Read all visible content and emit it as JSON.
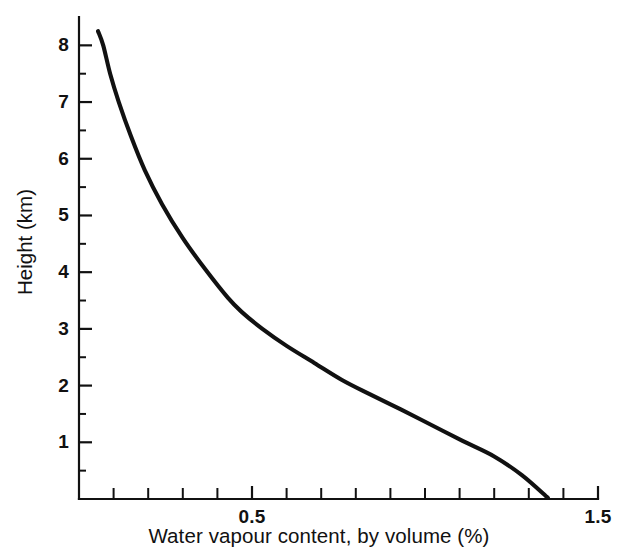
{
  "chart_data": {
    "type": "line",
    "title": "",
    "subtitle": "",
    "xlabel": "Water vapour content, by volume (%)",
    "ylabel": "Height (km)",
    "xlim": [
      0.0,
      1.5
    ],
    "ylim": [
      0.0,
      8.5
    ],
    "grid": false,
    "legend": null,
    "x_major_ticks": [
      0.5,
      1.5
    ],
    "x_major_tick_labels": [
      "0.5",
      "1.5"
    ],
    "x_minor_tick_step": 0.1,
    "x_minor_ticks": [
      0.1,
      0.2,
      0.3,
      0.4,
      0.6,
      0.7,
      0.8,
      0.9,
      1.0,
      1.1,
      1.2,
      1.3,
      1.4
    ],
    "y_major_ticks": [
      1,
      2,
      3,
      4,
      5,
      6,
      7,
      8
    ],
    "y_major_tick_labels": [
      "1",
      "2",
      "3",
      "4",
      "5",
      "6",
      "7",
      "8"
    ],
    "y_minor_tick_step": 0.5,
    "y_minor_ticks": [
      0.5,
      1.5,
      2.5,
      3.5,
      4.5,
      5.5,
      6.5,
      7.5
    ],
    "axis_color": "#111111",
    "curve_color": "#111111",
    "series": [
      {
        "name": "Water vapour profile",
        "x": [
          0.055,
          0.07,
          0.09,
          0.115,
          0.15,
          0.19,
          0.24,
          0.3,
          0.365,
          0.43,
          0.47,
          0.53,
          0.6,
          0.68,
          0.76,
          0.84,
          0.93,
          1.02,
          1.11,
          1.2,
          1.28,
          1.355
        ],
        "y": [
          8.25,
          8.0,
          7.5,
          7.0,
          6.4,
          5.8,
          5.2,
          4.6,
          4.05,
          3.55,
          3.3,
          3.0,
          2.7,
          2.4,
          2.1,
          1.85,
          1.58,
          1.3,
          1.02,
          0.75,
          0.42,
          0.02
        ]
      }
    ]
  },
  "axis_labels": {
    "x": "Water vapour content, by volume (%)",
    "y": "Height (km)"
  }
}
